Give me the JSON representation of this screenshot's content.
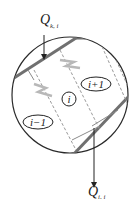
{
  "diagram": {
    "title": "",
    "labels": {
      "q_top_main": "Q",
      "q_top_sub": "k, i",
      "q_bottom_main": "Q",
      "q_bottom_sub": "i, i",
      "cell_prev": "i−1",
      "cell_curr": "i",
      "cell_next": "i+1"
    },
    "colors": {
      "outline": "#2a2a2a",
      "thick_band": "#6e6e6e",
      "dashed": "#9a9a9a",
      "zigzag": "#b8b8b8"
    }
  }
}
